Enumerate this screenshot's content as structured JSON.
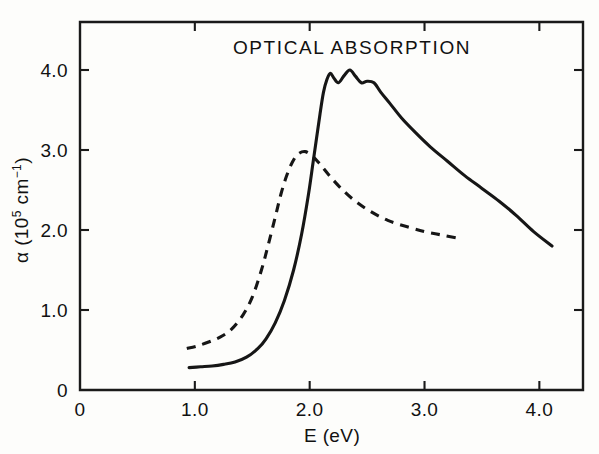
{
  "figure": {
    "title": "OPTICAL ABSORPTION",
    "background_color": "#fdfdfb",
    "ink_color": "#161616"
  },
  "axes": {
    "x_label": "E (eV)",
    "y_label_parts": {
      "symbol": "α",
      "open": " (10",
      "exponent_1": "5",
      "unit": " cm",
      "exponent_2": "−1",
      "close": ")"
    },
    "y_label_plain": "α (10⁵ cm⁻¹)",
    "x_ticks": [
      "0",
      "1.0",
      "2.0",
      "3.0",
      "4.0"
    ],
    "y_ticks": [
      "0",
      "1.0",
      "2.0",
      "3.0",
      "4.0"
    ]
  },
  "chart_data": {
    "type": "line",
    "title": "OPTICAL ABSORPTION",
    "xlabel": "E (eV)",
    "ylabel": "α (10⁵ cm⁻¹)",
    "xlim": [
      0,
      4.38
    ],
    "ylim": [
      0,
      4.6
    ],
    "xticks": [
      0,
      1.0,
      2.0,
      3.0,
      4.0
    ],
    "yticks": [
      0,
      1.0,
      2.0,
      3.0,
      4.0
    ],
    "grid": false,
    "legend": null,
    "annotations": [
      {
        "text": "OPTICAL ABSORPTION",
        "x": 2.15,
        "y": 4.28
      }
    ],
    "series": [
      {
        "name": "solid-curve",
        "style": "solid",
        "color": "#161616",
        "x": [
          0.95,
          1.05,
          1.15,
          1.25,
          1.35,
          1.45,
          1.55,
          1.62,
          1.7,
          1.78,
          1.86,
          1.93,
          1.99,
          2.03,
          2.06,
          2.09,
          2.12,
          2.15,
          2.18,
          2.21,
          2.25,
          2.3,
          2.35,
          2.4,
          2.45,
          2.5,
          2.56,
          2.62,
          2.7,
          2.8,
          2.92,
          3.05,
          3.2,
          3.35,
          3.5,
          3.65,
          3.8,
          3.95,
          4.11
        ],
        "y": [
          0.28,
          0.29,
          0.3,
          0.32,
          0.35,
          0.41,
          0.52,
          0.64,
          0.84,
          1.12,
          1.5,
          1.95,
          2.45,
          2.85,
          3.15,
          3.45,
          3.72,
          3.88,
          3.96,
          3.9,
          3.84,
          3.93,
          4.0,
          3.92,
          3.84,
          3.86,
          3.84,
          3.72,
          3.58,
          3.4,
          3.22,
          3.04,
          2.86,
          2.68,
          2.52,
          2.36,
          2.18,
          1.98,
          1.8
        ]
      },
      {
        "name": "dashed-curve",
        "style": "dashed",
        "color": "#161616",
        "x": [
          0.93,
          1.02,
          1.12,
          1.22,
          1.32,
          1.42,
          1.5,
          1.58,
          1.64,
          1.7,
          1.75,
          1.8,
          1.85,
          1.9,
          1.96,
          2.02,
          2.08,
          2.16,
          2.26,
          2.38,
          2.52,
          2.68,
          2.85,
          3.0,
          3.14,
          3.28
        ],
        "y": [
          0.52,
          0.55,
          0.6,
          0.66,
          0.76,
          0.94,
          1.16,
          1.5,
          1.82,
          2.16,
          2.45,
          2.68,
          2.85,
          2.95,
          2.98,
          2.93,
          2.84,
          2.7,
          2.54,
          2.38,
          2.24,
          2.12,
          2.04,
          1.98,
          1.94,
          1.9
        ]
      }
    ]
  }
}
